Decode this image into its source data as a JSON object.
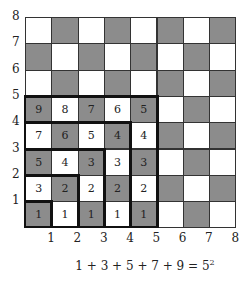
{
  "grid": {
    "size": 8,
    "origin_x": 25,
    "origin_y": 17,
    "cell": 26.3,
    "colors": {
      "dark": "#8c8c8c",
      "light": "#ffffff",
      "line": "#333333",
      "thick_line": "#111111"
    },
    "shading_rule": "dark when (col+row) is even, col/row 1-indexed from bottom-left"
  },
  "y_labels": [
    "1",
    "2",
    "3",
    "4",
    "5",
    "6",
    "7",
    "8"
  ],
  "x_labels": [
    "1",
    "2",
    "3",
    "4",
    "5",
    "6",
    "7",
    "8"
  ],
  "numbered_cells": {
    "row5": [
      "9",
      "8",
      "7",
      "6",
      "5"
    ],
    "row4": [
      "7",
      "6",
      "5",
      "4",
      "4"
    ],
    "row3": [
      "5",
      "4",
      "3",
      "3",
      "3"
    ],
    "row2": [
      "3",
      "2",
      "2",
      "2",
      "2"
    ],
    "row1": [
      "1",
      "1",
      "1",
      "1",
      "1"
    ]
  },
  "gnomon_squares": [
    1,
    2,
    3,
    4,
    5
  ],
  "equation": {
    "text": "1 + 3 + 5 + 7 + 9 = 5",
    "exponent": "2"
  }
}
